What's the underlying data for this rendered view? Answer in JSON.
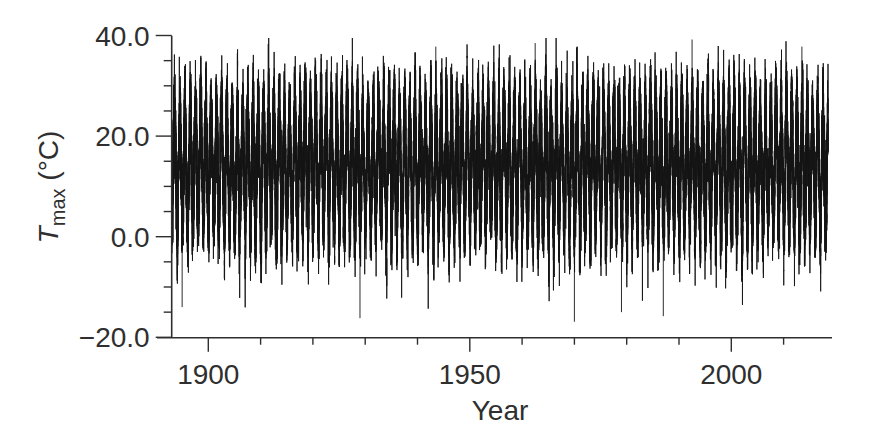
{
  "chart_data": {
    "type": "line",
    "title": "",
    "xlabel": "Year",
    "ylabel": {
      "symbol": "T",
      "subscript": "max",
      "unit": " (°C)"
    },
    "xlim": [
      1891.5,
      2019
    ],
    "ylim": [
      -20.0,
      40.0
    ],
    "x_major_ticks": [
      1900,
      1950,
      2000
    ],
    "x_major_tick_labels": [
      "1900",
      "1950",
      "2000"
    ],
    "x_minor_ticks": [
      1910,
      1920,
      1930,
      1940,
      1960,
      1970,
      1980,
      1990,
      2010
    ],
    "y_major_ticks": [
      40.0,
      20.0,
      0.0,
      -20.0
    ],
    "y_major_tick_labels": [
      "40.0",
      "20.0",
      "0.0",
      "−20.0"
    ],
    "y_minor_ticks": [
      35,
      30,
      25,
      15,
      10,
      5,
      -5,
      -10,
      -15
    ],
    "grid": false,
    "legend": null,
    "series": [
      {
        "name": "Daily maximum temperature",
        "color": "#151515",
        "x_start": 1893.0,
        "x_end": 2018.5,
        "sampling": "daily",
        "description": "Dense daily series with strong annual cycle",
        "mean": 14.0,
        "annual_amplitude": 10.5,
        "noise_sd": 4.6,
        "typical_summer_peak_range": [
          30,
          37
        ],
        "typical_winter_trough_range": [
          -12,
          -3
        ],
        "dense_band_range": [
          5,
          25
        ],
        "notable_extremes": [
          {
            "x": 1992.5,
            "y": 39.2,
            "label": "highest peak"
          },
          {
            "x": 1943.5,
            "y": 37.8
          },
          {
            "x": 1962.5,
            "y": 38.5
          },
          {
            "x": 2013.5,
            "y": 37.8
          },
          {
            "x": 1970.0,
            "y": -16.9,
            "label": "lowest trough"
          },
          {
            "x": 1929.0,
            "y": -16.2
          },
          {
            "x": 1987.0,
            "y": -15.8
          },
          {
            "x": 1979.0,
            "y": -15.0
          },
          {
            "x": 1895.0,
            "y": -14.0
          }
        ]
      }
    ]
  },
  "plot": {
    "x_px": {
      "origin_year": 1890,
      "origin_px": 156.0,
      "px_per_year": 5.23
    },
    "y_px": {
      "zero_px": 236.7,
      "px_per_unit": 5.03
    },
    "axis_left_px": 171.7,
    "axis_bottom_px": 337.7,
    "axis_right_px": 832.0,
    "axis_top_px": 35.7,
    "x_axis_start_px": 157.0,
    "seed": 20240
  }
}
